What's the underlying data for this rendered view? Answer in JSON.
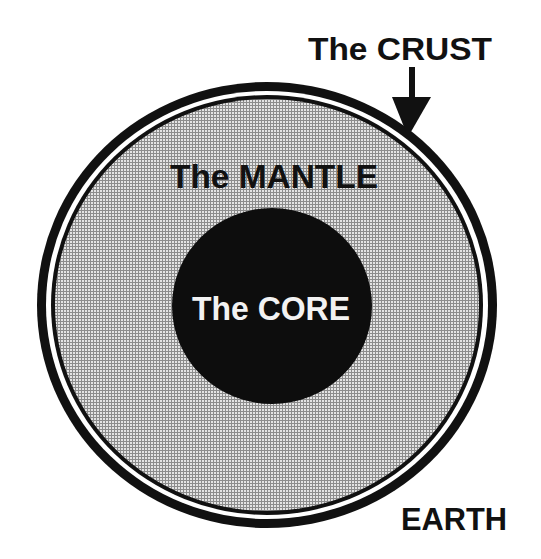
{
  "diagram": {
    "labels": {
      "crust": "The CRUST",
      "mantle": "The MANTLE",
      "core": "The CORE",
      "earth": "EARTH"
    },
    "layers": [
      {
        "name": "crust",
        "label": "The CRUST",
        "style": "double black ring"
      },
      {
        "name": "mantle",
        "label": "The MANTLE",
        "style": "gray stippled fill"
      },
      {
        "name": "core",
        "label": "The CORE",
        "style": "solid black circle"
      }
    ],
    "colors": {
      "ring": "#111111",
      "gap": "#ffffff",
      "mantle_light": "#e4e4e4",
      "mantle_grid": "#8c8c8c",
      "core": "#0d0d0d",
      "core_text": "#f2f2f2",
      "label_text": "#111111"
    },
    "arrow": {
      "points_to": "crust",
      "direction": "down"
    }
  }
}
